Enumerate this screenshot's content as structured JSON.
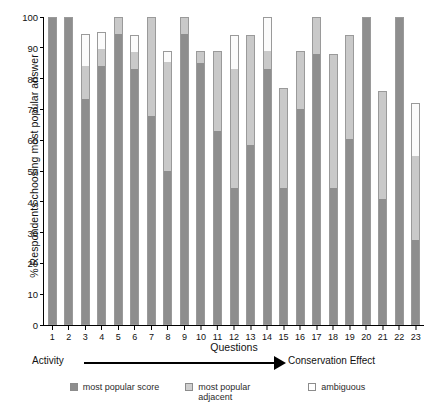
{
  "chart_data": {
    "type": "bar",
    "stacked": true,
    "title": "",
    "xlabel": "Questions",
    "ylabel": "% Respondents choosing most popular answer",
    "ylim": [
      0,
      100
    ],
    "ytick_labels": [
      "0",
      "10",
      "20",
      "30",
      "40",
      "50",
      "60",
      "70",
      "80",
      "90",
      "100"
    ],
    "yticks": [
      0,
      10,
      20,
      30,
      40,
      50,
      60,
      70,
      80,
      90,
      100
    ],
    "grid": false,
    "legend_position": "bottom",
    "categories": [
      "1",
      "2",
      "3",
      "4",
      "5",
      "6",
      "7",
      "8",
      "9",
      "10",
      "11",
      "12",
      "13",
      "14",
      "15",
      "16",
      "17",
      "18",
      "19",
      "20",
      "21",
      "22",
      "23"
    ],
    "series": [
      {
        "name": "most popular score",
        "color": "#8e8e8e",
        "values": [
          100,
          100,
          73.5,
          84,
          94.5,
          83,
          68,
          50,
          94.5,
          85,
          63,
          44.5,
          58.5,
          83,
          44.5,
          70,
          88,
          44.5,
          60.5,
          100,
          41,
          100,
          27.5
        ]
      },
      {
        "name": "most popular adjacent",
        "color": "#c9c9c9",
        "values": [
          0,
          0,
          10.5,
          5.5,
          5.5,
          5.5,
          32,
          35.5,
          5.5,
          4,
          26,
          38.5,
          35.5,
          6,
          32.5,
          19,
          12,
          43.5,
          33.5,
          0,
          35,
          0,
          27.5
        ]
      },
      {
        "name": "ambiguous",
        "color": "#ffffff",
        "values": [
          0,
          0,
          10.5,
          5.5,
          0,
          5.5,
          0,
          3.5,
          0,
          0,
          0,
          11,
          0,
          11,
          0,
          0,
          0,
          0,
          0,
          0,
          0,
          0,
          17
        ]
      }
    ],
    "bar_totals": [
      100,
      100,
      94.5,
      95,
      100,
      94,
      100,
      89,
      100,
      89,
      89,
      94,
      94,
      100,
      77,
      89,
      100,
      88,
      94,
      100,
      76,
      100,
      72
    ]
  },
  "axis": {
    "arrow_left_label": "Activity",
    "arrow_right_label": "Conservation Effect"
  },
  "legend": {
    "items": [
      {
        "label": "most popular score",
        "swatch": "score"
      },
      {
        "label": "most popular adjacent",
        "swatch": "adjacent"
      },
      {
        "label": "ambiguous",
        "swatch": "ambiguous"
      }
    ]
  }
}
